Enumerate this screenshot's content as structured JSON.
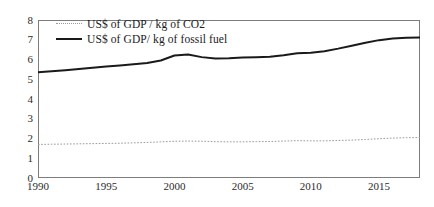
{
  "chart_data": {
    "type": "line",
    "title": "",
    "subtitle": "",
    "xlabel": "",
    "ylabel": "",
    "xlim": [
      1990,
      2018
    ],
    "ylim": [
      0,
      8
    ],
    "grid": false,
    "legend_position": "top-left",
    "yticks": [
      "8",
      "7",
      "6",
      "5",
      "4",
      "3",
      "2",
      "1",
      "0"
    ],
    "ytick_values": [
      8,
      7,
      6,
      5,
      4,
      3,
      2,
      1,
      0
    ],
    "xticks": [
      "1990",
      "1995",
      "2000",
      "2005",
      "2010",
      "2015"
    ],
    "xtick_values": [
      1990,
      1995,
      2000,
      2005,
      2010,
      2015
    ],
    "x": [
      1990,
      1991,
      1992,
      1993,
      1994,
      1995,
      1996,
      1997,
      1998,
      1999,
      2000,
      2001,
      2002,
      2003,
      2004,
      2005,
      2006,
      2007,
      2008,
      2009,
      2010,
      2011,
      2012,
      2013,
      2014,
      2015,
      2016,
      2017,
      2018
    ],
    "series": [
      {
        "name": "US$ of GDP / kg of CO2",
        "style": "dotted",
        "color": "#9a9a9a",
        "values": [
          1.7,
          1.71,
          1.72,
          1.73,
          1.74,
          1.75,
          1.76,
          1.78,
          1.8,
          1.83,
          1.86,
          1.87,
          1.86,
          1.84,
          1.83,
          1.83,
          1.84,
          1.85,
          1.87,
          1.89,
          1.88,
          1.88,
          1.9,
          1.92,
          1.95,
          1.99,
          2.02,
          2.04,
          2.05
        ]
      },
      {
        "name": "US$ of GDP/ kg of fossil fuel",
        "style": "solid",
        "color": "#1a1a1a",
        "values": [
          5.35,
          5.4,
          5.46,
          5.52,
          5.58,
          5.64,
          5.7,
          5.76,
          5.82,
          5.95,
          6.2,
          6.25,
          6.12,
          6.05,
          6.06,
          6.1,
          6.12,
          6.14,
          6.22,
          6.32,
          6.34,
          6.42,
          6.55,
          6.7,
          6.85,
          6.98,
          7.06,
          7.1,
          7.11
        ]
      }
    ]
  },
  "legend": {
    "entries": [
      {
        "label": "US$ of GDP / kg of CO2",
        "marker": "dotted-line-marker"
      },
      {
        "label": "US$ of GDP/ kg of fossil fuel",
        "marker": "solid-line-marker"
      }
    ]
  }
}
